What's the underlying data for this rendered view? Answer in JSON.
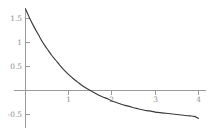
{
  "chart_data": {
    "type": "line",
    "title": "",
    "subtitle": "",
    "xlabel": "",
    "ylabel": "",
    "xlim": [
      -0.05,
      4.05
    ],
    "ylim": [
      -0.75,
      1.75
    ],
    "grid": false,
    "legend": null,
    "axis_style": "centered-cross",
    "x_ticks": [
      1,
      2,
      3,
      4
    ],
    "x_tick_labels": [
      "1",
      "2",
      "3",
      "4"
    ],
    "y_ticks": [
      -0.5,
      0.5,
      1,
      1.5
    ],
    "y_tick_labels": [
      "-0.5",
      "0.5",
      "1",
      "1.5"
    ],
    "curve_description": "exponential decay approaching horizontal asymptote near -0.6",
    "function": "2.3*exp(-0.9*x) - 0.6",
    "zero_crossing_x": 1.94,
    "asymptote_y": -0.6,
    "x": [
      0,
      0.1,
      0.2,
      0.3,
      0.4,
      0.5,
      0.6,
      0.7,
      0.8,
      0.9,
      1.0,
      1.1,
      1.2,
      1.3,
      1.4,
      1.5,
      1.6,
      1.7,
      1.8,
      1.9,
      2.0,
      2.1,
      2.2,
      2.3,
      2.4,
      2.5,
      2.6,
      2.7,
      2.8,
      2.9,
      3.0,
      3.1,
      3.2,
      3.3,
      3.4,
      3.5,
      3.6,
      3.7,
      3.8,
      3.9,
      4.0
    ],
    "y": [
      1.7,
      1.5,
      1.32,
      1.16,
      1.0,
      0.87,
      0.74,
      0.63,
      0.52,
      0.42,
      0.33,
      0.25,
      0.18,
      0.11,
      0.05,
      0.0,
      -0.05,
      -0.1,
      -0.14,
      -0.17,
      -0.22,
      -0.25,
      -0.28,
      -0.31,
      -0.33,
      -0.36,
      -0.38,
      -0.4,
      -0.42,
      -0.43,
      -0.45,
      -0.46,
      -0.47,
      -0.48,
      -0.49,
      -0.5,
      -0.51,
      -0.52,
      -0.53,
      -0.54,
      -0.58
    ],
    "colors": {
      "curve": "#3a3a3a",
      "axis": "#9a9a9a",
      "tick_label": "#8d8d8d",
      "background": "#ffffff"
    }
  }
}
